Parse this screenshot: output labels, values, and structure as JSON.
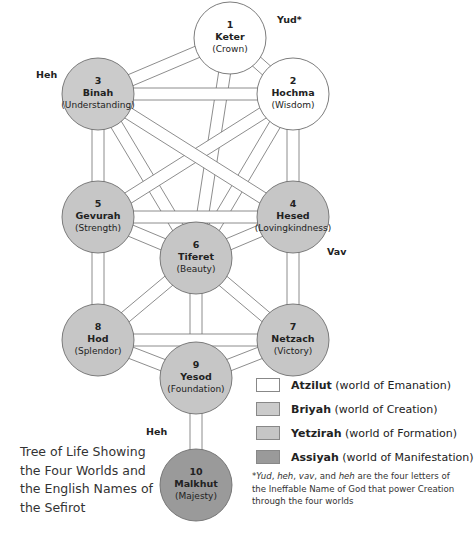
{
  "diagram": {
    "title": "Tree of Life Showing the Four Worlds and the English Names of the Sefirot",
    "caption_lines": [
      "Tree of Life Showing",
      "the Four Worlds and",
      "the English Names of",
      "the Sefirot"
    ],
    "colors": {
      "atzilut": "#ffffff",
      "briyah": "#cbcbcb",
      "yetzirah": "#c6c6c6",
      "assiyah": "#9a9a9a",
      "stroke": "#6e6e6e"
    },
    "sefirot": [
      {
        "number": "1",
        "name": "Keter",
        "english": "(Crown)",
        "world": "atzilut"
      },
      {
        "number": "2",
        "name": "Hochma",
        "english": "(Wisdom)",
        "world": "atzilut"
      },
      {
        "number": "3",
        "name": "Binah",
        "english": "(Understanding)",
        "world": "briyah"
      },
      {
        "number": "4",
        "name": "Hesed",
        "english": "(Lovingkindness)",
        "world": "yetzirah"
      },
      {
        "number": "5",
        "name": "Gevurah",
        "english": "(Strength)",
        "world": "yetzirah"
      },
      {
        "number": "6",
        "name": "Tiferet",
        "english": "(Beauty)",
        "world": "yetzirah"
      },
      {
        "number": "7",
        "name": "Netzach",
        "english": "(Victory)",
        "world": "yetzirah"
      },
      {
        "number": "8",
        "name": "Hod",
        "english": "(Splendor)",
        "world": "yetzirah"
      },
      {
        "number": "9",
        "name": "Yesod",
        "english": "(Foundation)",
        "world": "yetzirah"
      },
      {
        "number": "10",
        "name": "Malkhut",
        "english": "(Majesty)",
        "world": "assiyah"
      }
    ],
    "letters": {
      "yud": "Yud*",
      "heh_upper": "Heh",
      "vav": "Vav",
      "heh_lower": "Heh"
    },
    "legend": [
      {
        "name": "Atzilut",
        "desc": " (world of Emanation)",
        "color": "#ffffff"
      },
      {
        "name": "Briyah",
        "desc": " (world of Creation)",
        "color": "#cbcbcb"
      },
      {
        "name": "Yetzirah",
        "desc": " (world of Formation)",
        "color": "#c6c6c6"
      },
      {
        "name": "Assiyah",
        "desc": " (world of Manifestation)",
        "color": "#9a9a9a"
      }
    ],
    "footnote": {
      "star": "*",
      "yud": "Yud",
      "sep1": ", ",
      "heh": "heh",
      "sep2": ", ",
      "vav": "vav",
      "sep3": ", and ",
      "heh2": "heh",
      "rest": " are the four letters of the Ineffable Name of God that power Creation through the four worlds"
    }
  }
}
